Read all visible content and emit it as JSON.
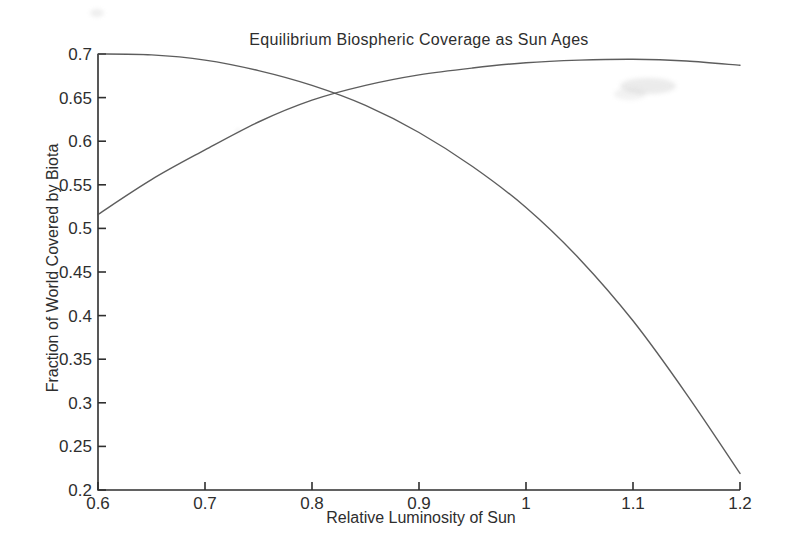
{
  "chart_data": {
    "type": "line",
    "title": "Equilibrium Biospheric Coverage as Sun Ages",
    "xlabel": "Relative Luminosity of Sun",
    "ylabel": "Fraction of World Covered by Biota",
    "xlim": [
      0.6,
      1.2
    ],
    "ylim": [
      0.2,
      0.7
    ],
    "grid": false,
    "legend": "none",
    "x_ticks": [
      0.6,
      0.7,
      0.8,
      0.9,
      1,
      1.1,
      1.2
    ],
    "x_tick_labels": [
      "0.6",
      "0.7",
      "0.8",
      "0.9",
      "1",
      "1.1",
      "1.2"
    ],
    "y_ticks": [
      0.2,
      0.25,
      0.3,
      0.35,
      0.4,
      0.45,
      0.5,
      0.55,
      0.6,
      0.65,
      0.7
    ],
    "y_tick_labels": [
      "0.2",
      "0.25",
      "0.3",
      "0.35",
      "0.4",
      "0.45",
      "0.5",
      "0.55",
      "0.6",
      "0.65",
      "0.7"
    ],
    "x": [
      0.6,
      0.65,
      0.7,
      0.75,
      0.8,
      0.85,
      0.9,
      0.95,
      1.0,
      1.05,
      1.1,
      1.15,
      1.2
    ],
    "series": [
      {
        "name": "declining-coverage-curve",
        "values": [
          0.7,
          0.699,
          0.693,
          0.681,
          0.664,
          0.641,
          0.61,
          0.571,
          0.524,
          0.465,
          0.394,
          0.31,
          0.219
        ]
      },
      {
        "name": "rising-coverage-curve",
        "values": [
          0.516,
          0.556,
          0.59,
          0.622,
          0.647,
          0.664,
          0.676,
          0.684,
          0.69,
          0.693,
          0.694,
          0.692,
          0.687
        ]
      }
    ],
    "colors": {
      "line": "#4f4f4f",
      "axis": "#2f2f2f",
      "text": "#2e2e2e",
      "background": "#ffffff"
    }
  }
}
